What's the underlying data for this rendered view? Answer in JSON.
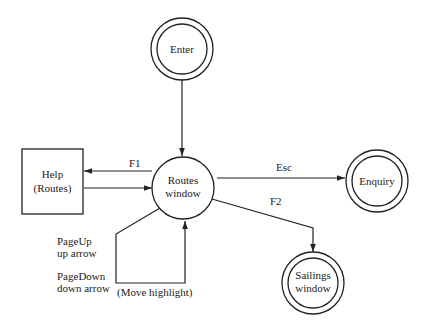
{
  "diagram": {
    "type": "state-transition",
    "nodes": {
      "enter": {
        "label": "Enter",
        "shape": "double-circle"
      },
      "routes": {
        "line1": "Routes",
        "line2": "window",
        "shape": "circle"
      },
      "help": {
        "line1": "Help",
        "line2": "(Routes)",
        "shape": "rectangle"
      },
      "enquiry": {
        "label": "Enquiry",
        "shape": "double-circle"
      },
      "sailings": {
        "line1": "Sailings",
        "line2": "window",
        "shape": "double-circle"
      }
    },
    "edges": {
      "enter_to_routes": {
        "label": ""
      },
      "routes_to_help": {
        "label": "F1"
      },
      "help_to_routes": {
        "label": ""
      },
      "routes_to_enquiry": {
        "label": "Esc"
      },
      "routes_to_sailings": {
        "label": "F2"
      },
      "routes_loop": {
        "line1": "PageUp",
        "line2": "up arrow",
        "line3": "PageDown",
        "line4": "down arrow",
        "note": "(Move highlight)"
      }
    },
    "colors": {
      "stroke": "#222222",
      "background": "#ffffff"
    }
  }
}
